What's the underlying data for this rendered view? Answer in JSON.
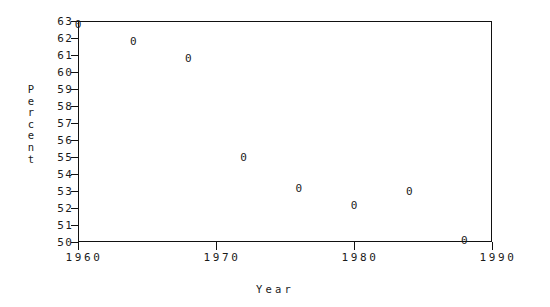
{
  "chart_data": {
    "type": "scatter",
    "title": "",
    "xlabel": "Year",
    "ylabel": "Percent",
    "x": [
      1960,
      1964,
      1968,
      1972,
      1976,
      1980,
      1984,
      1988
    ],
    "values": [
      62.8,
      61.8,
      60.8,
      55.0,
      53.2,
      52.2,
      53.0,
      50.1
    ],
    "series": [
      {
        "name": "Percent",
        "marker": "0",
        "x": [
          1960,
          1964,
          1968,
          1972,
          1976,
          1980,
          1984,
          1988
        ],
        "values": [
          62.8,
          61.8,
          60.8,
          55.0,
          53.2,
          52.2,
          53.0,
          50.1
        ]
      }
    ],
    "xlim": [
      1960,
      1990
    ],
    "ylim": [
      50,
      63
    ],
    "x_ticks": [
      1960,
      1970,
      1980,
      1990
    ],
    "x_tick_labels": [
      "1960",
      "1970",
      "1980",
      "1990"
    ],
    "y_ticks": [
      50,
      51,
      52,
      53,
      54,
      55,
      56,
      57,
      58,
      59,
      60,
      61,
      62,
      63
    ],
    "y_tick_labels": [
      "50",
      "51",
      "52",
      "53",
      "54",
      "55",
      "56",
      "57",
      "58",
      "59",
      "60",
      "61",
      "62",
      "63"
    ],
    "grid": false,
    "legend": false,
    "marker_symbol": "0",
    "colors": {
      "axis": "#111111",
      "marker": "#1a1a1a",
      "background": "#ffffff"
    }
  }
}
